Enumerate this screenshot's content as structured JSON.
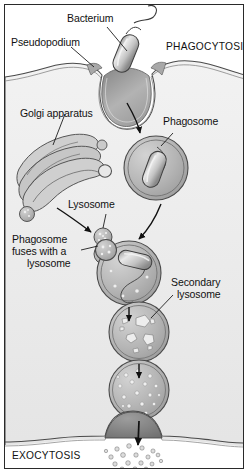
{
  "figure": {
    "border_color": "#2a2a2a",
    "cytoplasm_color": "#ebebeb",
    "organelle_fill": "#b9b9b9",
    "ink_color": "#111111"
  },
  "labels": {
    "bacterium": "Bacterium",
    "pseudopodium": "Pseudopodium",
    "phagocytosis": "PHAGOCYTOSIS",
    "golgi_apparatus": "Golgi apparatus",
    "phagosome": "Phagosome",
    "lysosome": "Lysosome",
    "fusion_line1": "Phagosome",
    "fusion_line2": "fuses with a",
    "fusion_line3": "lysosome",
    "secondary_line1": "Secondary",
    "secondary_line2": "lysosome",
    "exocytosis": "EXOCYTOSIS"
  },
  "stages": [
    {
      "name": "engulfment",
      "label": "Bacterium",
      "description": "Bacterium with flagellum captured by pseudopodia at the cell surface"
    },
    {
      "name": "phagosome",
      "label": "Phagosome",
      "description": "Internalized vesicle containing intact bacterium"
    },
    {
      "name": "fusion",
      "label": "Phagosome fuses with a lysosome",
      "description": "Lysosome docks onto phagosome membrane"
    },
    {
      "name": "secondary-lysosome",
      "label": "Secondary lysosome",
      "description": "Bacterium broken into irregular fragments"
    },
    {
      "name": "residual-body",
      "label": "",
      "description": "Contents fully digested into fine particles"
    },
    {
      "name": "exocytosis",
      "label": "EXOCYTOSIS",
      "description": "Residual particles expelled through the plasma membrane"
    }
  ],
  "organelles": [
    {
      "name": "golgi-apparatus",
      "label": "Golgi apparatus"
    },
    {
      "name": "lysosome",
      "label": "Lysosome"
    },
    {
      "name": "transport-vesicle",
      "label": ""
    }
  ]
}
